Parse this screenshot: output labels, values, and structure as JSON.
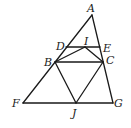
{
  "diagram": {
    "type": "geometry",
    "points": {
      "A": {
        "x": 92,
        "y": 15
      },
      "D": {
        "x": 66,
        "y": 47
      },
      "I": {
        "x": 85,
        "y": 47
      },
      "E": {
        "x": 100,
        "y": 47
      },
      "B": {
        "x": 55,
        "y": 62
      },
      "C": {
        "x": 103,
        "y": 62
      },
      "F": {
        "x": 23,
        "y": 103
      },
      "J": {
        "x": 76,
        "y": 103
      },
      "G": {
        "x": 113,
        "y": 103
      }
    },
    "labels": {
      "A": "A",
      "D": "D",
      "I": "I",
      "E": "E",
      "B": "B",
      "C": "C",
      "F": "F",
      "J": "J",
      "G": "G"
    },
    "segments": [
      [
        "A",
        "F"
      ],
      [
        "A",
        "G"
      ],
      [
        "F",
        "G"
      ],
      [
        "D",
        "E"
      ],
      [
        "B",
        "C"
      ],
      [
        "B",
        "I"
      ],
      [
        "I",
        "C"
      ],
      [
        "B",
        "J"
      ],
      [
        "C",
        "J"
      ]
    ],
    "colors": {
      "stroke": "#1a1a1a",
      "background": "#ffffff"
    }
  }
}
